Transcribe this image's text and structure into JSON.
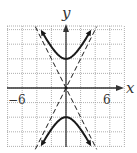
{
  "chart_data": {
    "type": "line",
    "title": "",
    "xlabel": "x",
    "ylabel": "y",
    "xlim": [
      -8,
      8
    ],
    "ylim": [
      -8,
      8.5
    ],
    "grid": true,
    "grid_step": 2,
    "tick_labels": {
      "x": [
        {
          "value": -6,
          "label": "−6"
        },
        {
          "value": 6,
          "label": "6"
        }
      ]
    },
    "series": [
      {
        "name": "hyperbola",
        "equation": "y^2/16 - x^2/4 = 1",
        "style": "solid",
        "vertices": [
          [
            0,
            4
          ],
          [
            0,
            -4
          ]
        ],
        "branches": [
          {
            "name": "upper",
            "points": [
              [
                -3.46,
                8
              ],
              [
                -2,
                5.66
              ],
              [
                -1,
                4.47
              ],
              [
                0,
                4
              ],
              [
                1,
                4.47
              ],
              [
                2,
                5.66
              ],
              [
                3.46,
                8
              ]
            ]
          },
          {
            "name": "lower",
            "points": [
              [
                -3.46,
                -8
              ],
              [
                -2,
                -5.66
              ],
              [
                -1,
                -4.47
              ],
              [
                0,
                -4
              ],
              [
                1,
                -4.47
              ],
              [
                2,
                -5.66
              ],
              [
                3.46,
                -8
              ]
            ]
          }
        ]
      },
      {
        "name": "asymptote 1",
        "equation": "y = 2x",
        "style": "dashed",
        "points": [
          [
            -4.2,
            -8.4
          ],
          [
            4.2,
            8.4
          ]
        ]
      },
      {
        "name": "asymptote 2",
        "equation": "y = -2x",
        "style": "dashed",
        "points": [
          [
            -4.2,
            8.4
          ],
          [
            4.2,
            -8.4
          ]
        ]
      }
    ],
    "center": [
      0,
      0
    ]
  },
  "labels": {
    "x_axis": "x",
    "y_axis": "y",
    "tick_neg6": "−6",
    "tick_pos6": "6"
  },
  "colors": {
    "curve": "#1a1a1a",
    "grid": "#9a9a9a",
    "axis": "#333333",
    "background": "#ffffff"
  }
}
